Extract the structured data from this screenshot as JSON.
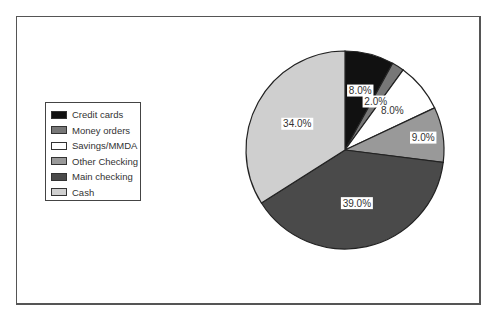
{
  "chart_data": {
    "type": "pie",
    "title": "",
    "categories": [
      "Credit cards",
      "Money orders",
      "Savings/MMDA",
      "Other Checking",
      "Main checking",
      "Cash"
    ],
    "values": [
      8.0,
      2.0,
      8.0,
      9.0,
      39.0,
      34.0
    ],
    "labels": [
      "8.0%",
      "2.0%",
      "8.0%",
      "9.0%",
      "39.0%",
      "34.0%"
    ],
    "colors": [
      "#111111",
      "#777777",
      "#ffffff",
      "#999999",
      "#4a4a4a",
      "#cfcfcf"
    ],
    "start_angle": "12 o'clock",
    "direction": "clockwise",
    "legend_position": "left",
    "grid": false
  },
  "legend": {
    "items": [
      {
        "label": "Credit cards",
        "color": "#111111"
      },
      {
        "label": "Money orders",
        "color": "#777777"
      },
      {
        "label": "Savings/MMDA",
        "color": "#ffffff"
      },
      {
        "label": "Other Checking",
        "color": "#999999"
      },
      {
        "label": "Main checking",
        "color": "#4a4a4a"
      },
      {
        "label": "Cash",
        "color": "#cfcfcf"
      }
    ]
  }
}
